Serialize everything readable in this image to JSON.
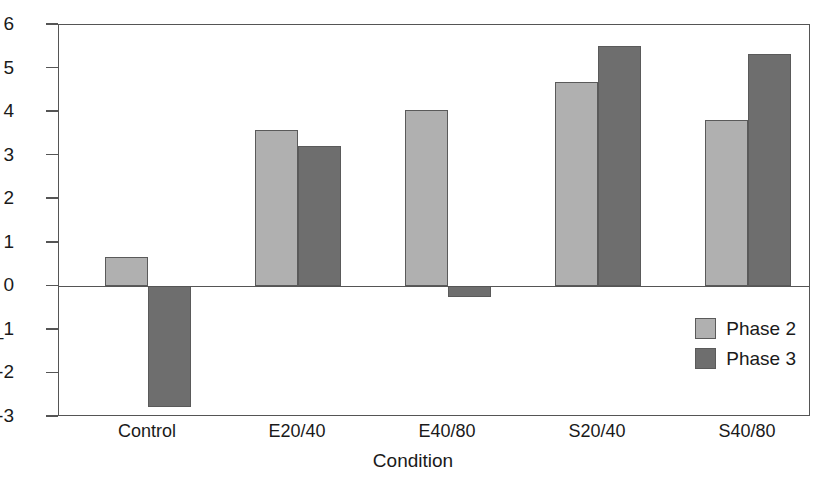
{
  "chart_data": {
    "type": "bar",
    "title": "",
    "xlabel": "Condition",
    "ylabel": "",
    "categories": [
      "Control",
      "E20/40",
      "E40/80",
      "S20/40",
      "S40/80"
    ],
    "series": [
      {
        "name": "Phase 2",
        "color": "#b0b0b0",
        "values": [
          0.68,
          3.6,
          4.05,
          4.68,
          3.83
        ]
      },
      {
        "name": "Phase 3",
        "color": "#6e6e6e",
        "values": [
          -2.77,
          3.23,
          -0.25,
          5.52,
          5.33
        ]
      }
    ],
    "ylim": [
      -3,
      6
    ],
    "yticks": [
      6,
      5,
      4,
      3,
      2,
      1,
      0,
      -1,
      -2,
      -3
    ],
    "ytick_labels": [
      "6",
      "5",
      "4",
      "3",
      "2",
      "1",
      "0",
      "_1",
      "-2",
      "-3"
    ],
    "grid": false,
    "legend_position": "inside-bottom-right"
  },
  "axes": {
    "x_title": "Condition"
  },
  "legend": {
    "items": [
      {
        "label": "Phase 2",
        "color": "#b0b0b0"
      },
      {
        "label": "Phase 3",
        "color": "#6e6e6e"
      }
    ]
  },
  "colors": {
    "phase2": "#b0b0b0",
    "phase3": "#6e6e6e",
    "axis": "#555555",
    "text": "#1a1a1a",
    "background": "#ffffff"
  }
}
